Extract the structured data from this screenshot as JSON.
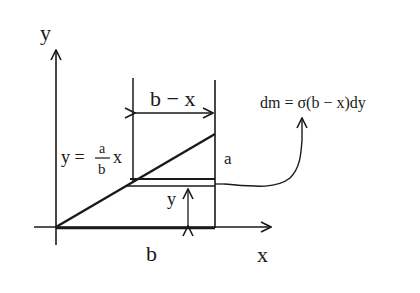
{
  "diagram": {
    "type": "mechanics-mass-element",
    "labels": {
      "y_axis": "y",
      "x_axis": "x",
      "width_dimension": "b − x",
      "base": "b",
      "height": "a",
      "strip_height": "y",
      "line_eq_lhs": "y =",
      "line_eq_num": "a",
      "line_eq_den": "b",
      "line_eq_var": "x",
      "mass_element": "dm = σ(b − x)dy"
    },
    "colors": {
      "ink": "#1a1a1a",
      "background": "#ffffff"
    }
  }
}
